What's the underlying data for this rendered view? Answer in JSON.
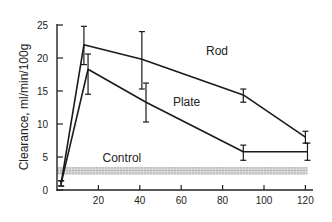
{
  "chart_data": {
    "type": "line",
    "title": "",
    "xlabel": "",
    "ylabel": "Clearance, ml/min/100g",
    "xlim": [
      0,
      125
    ],
    "ylim": [
      0,
      25
    ],
    "xticks": [
      20,
      40,
      60,
      80,
      100,
      120
    ],
    "yticks": [
      0,
      5,
      10,
      15,
      20,
      25
    ],
    "grid": false,
    "legend": "inline labels",
    "series": [
      {
        "name": "Rod",
        "label_pos": [
          72,
          20.5
        ],
        "points": [
          {
            "x": 2,
            "y": 1.0,
            "err_low": 0.6,
            "err_high": 1.4
          },
          {
            "x": 13,
            "y": 22.0,
            "err_low": 19.0,
            "err_high": 24.8
          },
          {
            "x": 41,
            "y": 19.8,
            "err_low": 15.3,
            "err_high": 24.0
          },
          {
            "x": 90,
            "y": 14.4,
            "err_low": 13.3,
            "err_high": 15.3
          },
          {
            "x": 120,
            "y": 8.0,
            "err_low": 7.1,
            "err_high": 8.9
          }
        ]
      },
      {
        "name": "Plate",
        "label_pos": [
          56,
          12.8
        ],
        "points": [
          {
            "x": 2,
            "y": 1.0,
            "err_low": 0.6,
            "err_high": 1.4
          },
          {
            "x": 15,
            "y": 18.3,
            "err_low": 14.5,
            "err_high": 20.6
          },
          {
            "x": 43,
            "y": 13.3,
            "err_low": 10.3,
            "err_high": 16.2
          },
          {
            "x": 90,
            "y": 5.8,
            "err_low": 4.5,
            "err_high": 6.8
          },
          {
            "x": 121,
            "y": 5.8,
            "err_low": 4.5,
            "err_high": 7.1
          }
        ]
      }
    ],
    "control_band": {
      "name": "Control",
      "x_range": [
        0,
        121
      ],
      "y_range": [
        2.3,
        3.5
      ],
      "label_pos": [
        22,
        4.3
      ]
    }
  }
}
